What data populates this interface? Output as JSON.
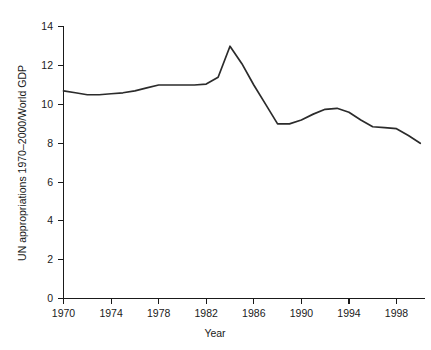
{
  "chart_data": {
    "type": "line",
    "title": "",
    "xlabel": "Year",
    "ylabel": "UN appropriations 1970–2000/World GDP",
    "xlim": [
      1970,
      2000
    ],
    "ylim": [
      0,
      14
    ],
    "grid": false,
    "legend": null,
    "xticks": [
      1970,
      1974,
      1978,
      1982,
      1986,
      1990,
      1994,
      1998
    ],
    "xtick_labels": [
      "1970",
      "1974",
      "1978",
      "1982",
      "1986",
      "1990",
      "1994",
      "1998"
    ],
    "yticks": [
      0,
      2,
      4,
      6,
      8,
      10,
      12,
      14
    ],
    "ytick_labels": [
      "0",
      "2",
      "4",
      "6",
      "8",
      "10",
      "12",
      "14"
    ],
    "series": [
      {
        "name": "UN appropriations / World GDP",
        "color": "#2b2b2b",
        "x": [
          1970,
          1971,
          1972,
          1973,
          1974,
          1975,
          1976,
          1977,
          1978,
          1979,
          1980,
          1981,
          1982,
          1983,
          1984,
          1985,
          1986,
          1987,
          1988,
          1989,
          1990,
          1991,
          1992,
          1993,
          1994,
          1995,
          1996,
          1997,
          1998,
          1999,
          2000
        ],
        "values": [
          10.7,
          10.6,
          10.5,
          10.5,
          10.55,
          10.6,
          10.7,
          10.85,
          11.0,
          11.0,
          11.0,
          11.0,
          11.05,
          11.4,
          13.0,
          12.1,
          11.0,
          10.0,
          9.0,
          9.0,
          9.2,
          9.5,
          9.75,
          9.8,
          9.6,
          9.2,
          8.85,
          8.8,
          8.75,
          8.4,
          8.0
        ]
      }
    ]
  },
  "axes": {
    "x_axis_title": "Year",
    "y_axis_title": "UN appropriations 1970–2000/World GDP"
  }
}
